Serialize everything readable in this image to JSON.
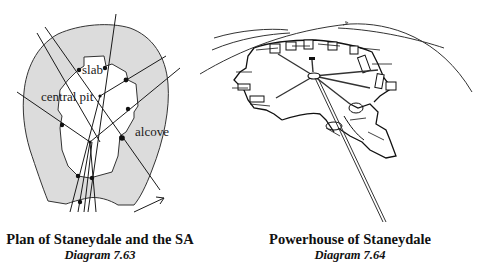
{
  "figures": [
    {
      "id": "plan",
      "title": "Plan of Staneydale and the SA",
      "subtitle": "Diagram 7.63",
      "labels": {
        "slab": "slab",
        "central_pit": "central pit",
        "alcove": "alcove"
      },
      "colors": {
        "wall_fill": "#dcdcdc",
        "line": "#1a1a1a"
      }
    },
    {
      "id": "perspective",
      "title": "Powerhouse of Staneydale",
      "subtitle": "Diagram 7.64",
      "colors": {
        "line": "#1a1a1a"
      }
    }
  ]
}
